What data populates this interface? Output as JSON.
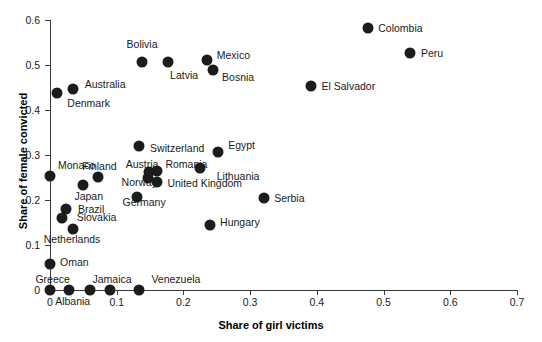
{
  "chart_data": {
    "type": "scatter",
    "title": "",
    "xlabel": "Share of girl victims",
    "ylabel": "Share of female convicted",
    "xlim": [
      0,
      0.7
    ],
    "ylim": [
      0,
      0.6
    ],
    "xticks": [
      "0",
      "0.1",
      "0.2",
      "0.3",
      "0.4",
      "0.5",
      "0.6",
      "0.7"
    ],
    "xtick_values": [
      0,
      0.1,
      0.2,
      0.3,
      0.4,
      0.5,
      0.6,
      0.7
    ],
    "yticks": [
      "0",
      "0.1",
      "0.2",
      "0.3",
      "0.4",
      "0.5",
      "0.6"
    ],
    "ytick_values": [
      0,
      0.1,
      0.2,
      0.3,
      0.4,
      0.5,
      0.6
    ],
    "grid": false,
    "legend": "none",
    "marker_color": "#1c1c1c",
    "axis_color": "#3a3a3a",
    "points": [
      {
        "label": "Colombia",
        "x": 0.477,
        "y": 0.582,
        "lx": 0.492,
        "ly": 0.582,
        "align": "left"
      },
      {
        "label": "Peru",
        "x": 0.54,
        "y": 0.527,
        "lx": 0.556,
        "ly": 0.527,
        "align": "left"
      },
      {
        "label": "El Salvador",
        "x": 0.391,
        "y": 0.453,
        "lx": 0.407,
        "ly": 0.453,
        "align": "left"
      },
      {
        "label": "Bolivia",
        "x": 0.138,
        "y": 0.507,
        "lx": 0.138,
        "ly": 0.546,
        "align": "center"
      },
      {
        "label": "Latvia",
        "x": 0.177,
        "y": 0.507,
        "lx": 0.18,
        "ly": 0.478,
        "align": "left"
      },
      {
        "label": "Mexico",
        "x": 0.235,
        "y": 0.511,
        "lx": 0.25,
        "ly": 0.522,
        "align": "left"
      },
      {
        "label": "Bosnia",
        "x": 0.244,
        "y": 0.489,
        "lx": 0.258,
        "ly": 0.473,
        "align": "left"
      },
      {
        "label": "Australia",
        "x": 0.034,
        "y": 0.447,
        "lx": 0.052,
        "ly": 0.458,
        "align": "left"
      },
      {
        "label": "Denmark",
        "x": 0.01,
        "y": 0.438,
        "lx": 0.026,
        "ly": 0.415,
        "align": "left"
      },
      {
        "label": "Switzerland",
        "x": 0.133,
        "y": 0.32,
        "lx": 0.15,
        "ly": 0.315,
        "align": "left"
      },
      {
        "label": "Egypt",
        "x": 0.252,
        "y": 0.307,
        "lx": 0.267,
        "ly": 0.322,
        "align": "left"
      },
      {
        "label": "Monaco",
        "x": 0.0,
        "y": 0.253,
        "lx": 0.012,
        "ly": 0.278,
        "align": "left"
      },
      {
        "label": "Finland",
        "x": 0.072,
        "y": 0.251,
        "lx": 0.074,
        "ly": 0.275,
        "align": "center"
      },
      {
        "label": "Austria",
        "x": 0.148,
        "y": 0.262,
        "lx": 0.138,
        "ly": 0.28,
        "align": "center"
      },
      {
        "label": "Romania",
        "x": 0.16,
        "y": 0.264,
        "lx": 0.173,
        "ly": 0.28,
        "align": "left"
      },
      {
        "label": "Lithuania",
        "x": 0.225,
        "y": 0.271,
        "lx": 0.25,
        "ly": 0.253,
        "align": "left"
      },
      {
        "label": "Norway",
        "x": 0.147,
        "y": 0.249,
        "lx": 0.134,
        "ly": 0.24,
        "align": "center"
      },
      {
        "label": "United Kingdom",
        "x": 0.161,
        "y": 0.24,
        "lx": 0.176,
        "ly": 0.238,
        "align": "left"
      },
      {
        "label": "Japan",
        "x": 0.05,
        "y": 0.233,
        "lx": 0.058,
        "ly": 0.209,
        "align": "center"
      },
      {
        "label": "Germany",
        "x": 0.131,
        "y": 0.207,
        "lx": 0.141,
        "ly": 0.196,
        "align": "center"
      },
      {
        "label": "Serbia",
        "x": 0.321,
        "y": 0.205,
        "lx": 0.336,
        "ly": 0.205,
        "align": "left"
      },
      {
        "label": "Brazil",
        "x": 0.024,
        "y": 0.18,
        "lx": 0.042,
        "ly": 0.18,
        "align": "left"
      },
      {
        "label": "Slovakia",
        "x": 0.018,
        "y": 0.16,
        "lx": 0.04,
        "ly": 0.162,
        "align": "left"
      },
      {
        "label": "Hungary",
        "x": 0.24,
        "y": 0.145,
        "lx": 0.255,
        "ly": 0.151,
        "align": "left"
      },
      {
        "label": "Netherlands",
        "x": 0.034,
        "y": 0.135,
        "lx": 0.033,
        "ly": 0.113,
        "align": "center"
      },
      {
        "label": "Oman",
        "x": 0.0,
        "y": 0.058,
        "lx": 0.015,
        "ly": 0.062,
        "align": "left"
      },
      {
        "label": "Greece",
        "x": 0.0,
        "y": 0.0,
        "lx": 0.004,
        "ly": 0.024,
        "align": "center"
      },
      {
        "label": "Albania",
        "x": 0.028,
        "y": 0.0,
        "lx": 0.034,
        "ly": -0.024,
        "align": "center"
      },
      {
        "label": "",
        "x": 0.06,
        "y": 0.0,
        "lx": 0.06,
        "ly": 0.0,
        "align": "left"
      },
      {
        "label": "Jamaica",
        "x": 0.09,
        "y": 0.0,
        "lx": 0.093,
        "ly": 0.024,
        "align": "center"
      },
      {
        "label": "Venezuela",
        "x": 0.133,
        "y": 0.0,
        "lx": 0.152,
        "ly": 0.024,
        "align": "left"
      }
    ]
  }
}
